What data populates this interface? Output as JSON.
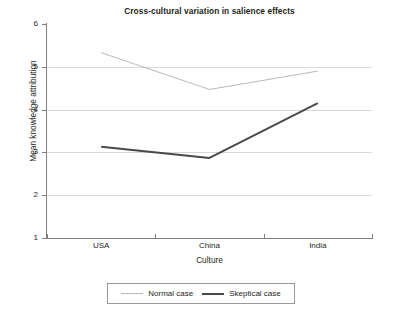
{
  "chart_data": {
    "type": "line",
    "title": "Cross-cultural variation in salience effects",
    "xlabel": "Culture",
    "ylabel": "Mean knowledge attribution",
    "categories": [
      "USA",
      "China",
      "India"
    ],
    "series": [
      {
        "name": "Normal case",
        "values": [
          5.33,
          4.47,
          4.9
        ],
        "color": "#b9b9b9",
        "line_width": 1
      },
      {
        "name": "Skeptical case",
        "values": [
          3.13,
          2.87,
          4.15
        ],
        "color": "#4a4a4a",
        "line_width": 2
      }
    ],
    "ylim": [
      1,
      6
    ],
    "yticks": [
      1,
      2,
      3,
      4,
      5,
      6
    ],
    "ytick_labels": [
      "1",
      "2",
      "3",
      "4",
      "5",
      "6"
    ],
    "xtick_labels": [
      "USA",
      "China",
      "India"
    ],
    "grid": true,
    "grid_axis": "y",
    "grid_color": "#d8d8d8",
    "legend_position": "bottom-center",
    "axis_color": "#808080",
    "background": "#ffffff"
  }
}
